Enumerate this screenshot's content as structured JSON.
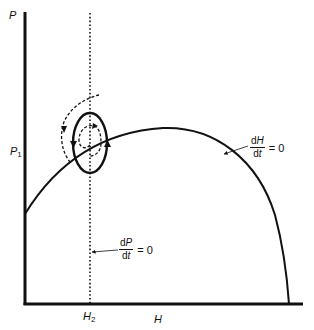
{
  "diagram": {
    "axes": {
      "y_label": "P",
      "x_label": "H",
      "y_tick_label": "P",
      "y_tick_sub": "1",
      "x_tick_label": "H",
      "x_tick_sub": "2"
    },
    "isoclines": {
      "dH_dt": {
        "num_d": "d",
        "num_var": "H",
        "den_d": "d",
        "den_var": "t",
        "eq": "= 0",
        "style": "solid hump curve"
      },
      "dP_dt": {
        "num_d": "d",
        "num_var": "P",
        "den_d": "d",
        "den_var": "t",
        "eq": "= 0",
        "style": "vertical dotted line at H2"
      }
    },
    "trajectories": [
      {
        "name": "limit-cycle",
        "style": "solid closed orbit"
      },
      {
        "name": "inner-spiral",
        "style": "dashed, spiraling outward to cycle"
      },
      {
        "name": "outer-spiral",
        "style": "dashed, spiraling inward to cycle"
      }
    ],
    "colors": {
      "ink": "#111111",
      "background": "#ffffff"
    }
  }
}
